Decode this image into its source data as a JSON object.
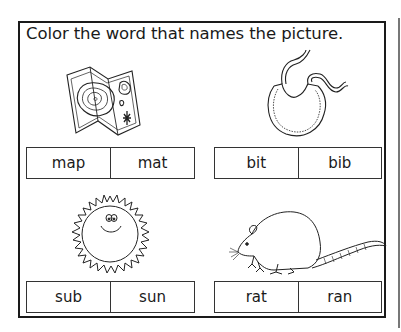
{
  "worksheet": {
    "instruction": "Color the word that names the picture.",
    "items": [
      {
        "picture": "map",
        "icon": "map-icon",
        "choices": [
          "map",
          "mat"
        ]
      },
      {
        "picture": "bib",
        "icon": "bib-icon",
        "choices": [
          "bit",
          "bib"
        ]
      },
      {
        "picture": "sun",
        "icon": "sun-icon",
        "choices": [
          "sub",
          "sun"
        ]
      },
      {
        "picture": "rat",
        "icon": "rat-icon",
        "choices": [
          "rat",
          "ran"
        ]
      }
    ]
  }
}
